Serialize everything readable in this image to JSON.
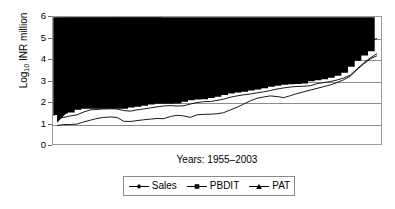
{
  "chart_data": {
    "type": "line",
    "title": "",
    "subtitle": "",
    "xlabel": "Years: 1955–2003",
    "ylabel": "Log10 INR million",
    "ylabel_base": "Log",
    "ylabel_sub": "10",
    "ylabel_rest": " INR million",
    "ylim": [
      0,
      6
    ],
    "yticks": [
      0,
      1,
      2,
      3,
      4,
      5,
      6
    ],
    "ytick_labels": [
      "0",
      "1",
      "2",
      "3",
      "4",
      "5",
      "6"
    ],
    "xlim": [
      1955,
      2003
    ],
    "xticks": [],
    "xtick_labels": [],
    "grid": "horizontal",
    "legend_position": "below-center",
    "x": [
      1955,
      1956,
      1957,
      1958,
      1959,
      1960,
      1961,
      1962,
      1963,
      1964,
      1965,
      1966,
      1967,
      1968,
      1969,
      1970,
      1971,
      1972,
      1973,
      1974,
      1975,
      1976,
      1977,
      1978,
      1979,
      1980,
      1981,
      1982,
      1983,
      1984,
      1985,
      1986,
      1987,
      1988,
      1989,
      1990,
      1991,
      1992,
      1993,
      1994,
      1995,
      1996,
      1997,
      1998,
      1999,
      2000,
      2001,
      2002,
      2003
    ],
    "series": [
      {
        "name": "Sales",
        "marker": "diamond",
        "color": "#000000",
        "values": [
          1.55,
          2.45,
          2.52,
          2.57,
          2.62,
          2.65,
          2.68,
          2.7,
          2.72,
          2.74,
          2.76,
          2.79,
          2.82,
          2.86,
          2.9,
          2.94,
          2.98,
          3.0,
          3.02,
          3.05,
          3.08,
          3.1,
          3.12,
          3.13,
          3.15,
          3.2,
          3.27,
          3.34,
          3.4,
          3.45,
          3.5,
          3.55,
          3.59,
          3.63,
          3.67,
          3.7,
          3.74,
          3.79,
          3.84,
          3.9,
          3.95,
          4.02,
          4.12,
          4.22,
          4.34,
          4.5,
          4.72,
          4.9,
          5.0
        ]
      },
      {
        "name": "PBDIT",
        "marker": "square",
        "color": "#000000",
        "values": [
          1.3,
          1.33,
          1.4,
          1.45,
          1.58,
          1.68,
          1.7,
          1.72,
          1.73,
          1.72,
          1.65,
          1.62,
          1.68,
          1.72,
          1.77,
          1.82,
          1.86,
          1.88,
          1.86,
          1.87,
          1.95,
          2.02,
          2.06,
          2.07,
          2.12,
          2.18,
          2.27,
          2.33,
          2.38,
          2.42,
          2.47,
          2.52,
          2.58,
          2.65,
          2.7,
          2.74,
          2.77,
          2.78,
          2.8,
          2.9,
          2.95,
          3.0,
          3.07,
          3.16,
          3.3,
          3.58,
          3.86,
          4.1,
          4.3
        ]
      },
      {
        "name": "PAT",
        "marker": "triangle",
        "color": "#000000",
        "values": [
          0.95,
          1.0,
          1.0,
          1.02,
          1.12,
          1.2,
          1.28,
          1.33,
          1.35,
          1.33,
          1.15,
          1.14,
          1.18,
          1.22,
          1.25,
          1.28,
          1.27,
          1.37,
          1.43,
          1.4,
          1.33,
          1.45,
          1.47,
          1.48,
          1.5,
          1.55,
          1.68,
          1.8,
          1.95,
          2.1,
          2.22,
          2.28,
          2.33,
          2.3,
          2.25,
          2.34,
          2.44,
          2.52,
          2.6,
          2.68,
          2.76,
          2.84,
          2.95,
          3.08,
          3.25,
          3.55,
          3.82,
          4.05,
          4.2
        ]
      }
    ]
  },
  "legend": {
    "items": [
      {
        "label": "Sales",
        "marker": "diamond-marker-icon"
      },
      {
        "label": "PBDIT",
        "marker": "square-marker-icon"
      },
      {
        "label": "PAT",
        "marker": "triangle-marker-icon"
      }
    ]
  }
}
